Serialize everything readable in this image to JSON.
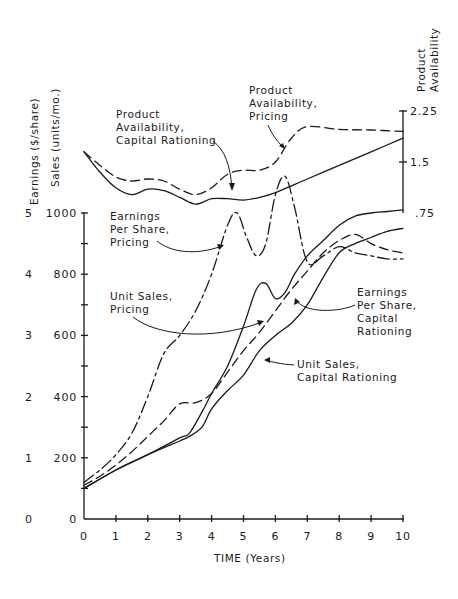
{
  "chart_data": {
    "type": "line",
    "title": "",
    "xlabel": "TIME (Years)",
    "ylabel_left_outer": "Earnings ($/share)",
    "ylabel_left_inner": "Sales (units/mo.)",
    "ylabel_right": "Product Availability",
    "x_ticks": [
      "0",
      "1",
      "2",
      "3",
      "4",
      "5",
      "6",
      "7",
      "8",
      "9",
      "10"
    ],
    "xlim": [
      0,
      10
    ],
    "y_left_earnings_ticks": [
      "0",
      "1",
      "2",
      "3",
      "4",
      "5"
    ],
    "y_left_sales_ticks": [
      "0",
      "200",
      "400",
      "600",
      "800",
      "1000"
    ],
    "ylim_sales": [
      0,
      1000
    ],
    "ylim_earnings": [
      0,
      5
    ],
    "y_right_ticks": [
      ".75",
      "1.5",
      "2.25"
    ],
    "ylim_right": [
      0.75,
      2.25
    ],
    "grid": false,
    "legend": "inline annotations with leader arrows",
    "series": [
      {
        "name": "Product Availability, Capital Rationing",
        "style": "solid",
        "axis": "right",
        "x": [
          0,
          0.5,
          1,
          1.5,
          2,
          2.5,
          3,
          3.5,
          4,
          4.5,
          5,
          5.5,
          6,
          7,
          8,
          9,
          10
        ],
        "y": [
          1.65,
          1.35,
          1.12,
          1.02,
          1.1,
          1.08,
          0.98,
          0.88,
          0.96,
          0.96,
          0.94,
          0.98,
          1.05,
          1.25,
          1.45,
          1.65,
          1.85
        ]
      },
      {
        "name": "Product Availability, Pricing",
        "style": "dashed",
        "axis": "right",
        "x": [
          0,
          0.5,
          1,
          1.5,
          2,
          2.5,
          3,
          3.5,
          4,
          4.5,
          5,
          5.5,
          6,
          6.5,
          7,
          8,
          9,
          10
        ],
        "y": [
          1.65,
          1.45,
          1.28,
          1.22,
          1.25,
          1.22,
          1.1,
          1.02,
          1.12,
          1.32,
          1.38,
          1.38,
          1.5,
          1.85,
          2.02,
          1.98,
          1.97,
          1.95
        ]
      },
      {
        "name": "Earnings Per Share, Pricing",
        "style": "dash-dot",
        "axis": "left_earnings",
        "x": [
          0,
          0.5,
          1,
          1.5,
          2,
          2.5,
          3,
          3.5,
          4,
          4.5,
          4.8,
          5.1,
          5.4,
          5.7,
          6.0,
          6.3,
          6.6,
          7,
          7.5,
          8,
          8.5,
          9,
          9.5,
          10
        ],
        "y": [
          0.6,
          0.8,
          1.05,
          1.4,
          2.0,
          2.7,
          3.0,
          3.4,
          4.0,
          4.8,
          5.0,
          4.6,
          4.3,
          4.5,
          5.3,
          5.6,
          5.1,
          4.2,
          4.3,
          4.45,
          4.35,
          4.3,
          4.25,
          4.25
        ]
      },
      {
        "name": "Unit Sales, Pricing",
        "style": "solid-thin",
        "axis": "left_sales",
        "x": [
          0,
          1,
          2,
          3,
          3.3,
          3.7,
          4,
          4.5,
          5,
          5.4,
          5.7,
          6,
          6.3,
          6.6,
          7,
          7.5,
          8,
          8.5,
          9,
          9.5,
          10
        ],
        "y": [
          100,
          160,
          210,
          265,
          280,
          350,
          410,
          500,
          630,
          750,
          770,
          720,
          740,
          800,
          860,
          910,
          960,
          990,
          1000,
          1005,
          1010
        ]
      },
      {
        "name": "Earnings Per Share, Capital Rationing",
        "style": "dashed",
        "axis": "left_earnings",
        "x": [
          0,
          0.5,
          1,
          1.5,
          2,
          2.5,
          3,
          3.5,
          4,
          4.5,
          5,
          5.5,
          6,
          6.5,
          7,
          7.5,
          8,
          8.5,
          9,
          9.5,
          10
        ],
        "y": [
          0.55,
          0.7,
          0.88,
          1.1,
          1.35,
          1.6,
          1.88,
          1.9,
          2.05,
          2.4,
          2.75,
          3.05,
          3.4,
          3.75,
          4.05,
          4.35,
          4.55,
          4.65,
          4.5,
          4.4,
          4.35
        ]
      },
      {
        "name": "Unit Sales, Capital Rationing",
        "style": "solid",
        "axis": "left_sales",
        "x": [
          0,
          1,
          2,
          3,
          3.3,
          3.7,
          4,
          4.5,
          5,
          5.5,
          6,
          6.5,
          7,
          7.5,
          8,
          8.5,
          9,
          9.5,
          10
        ],
        "y": [
          100,
          160,
          210,
          255,
          270,
          300,
          360,
          420,
          470,
          550,
          600,
          640,
          700,
          790,
          870,
          900,
          920,
          940,
          950
        ]
      }
    ],
    "annotations": [
      "Product Availability, Capital Rationing",
      "Product Availability, Pricing",
      "Earnings Per Share, Pricing",
      "Unit Sales, Pricing",
      "Earnings Per Share, Capital Rationing",
      "Unit Sales, Capital Rationing"
    ]
  },
  "labels": {
    "y_earnings": "Earnings ($/share)",
    "y_sales": "Sales (units/mo.)",
    "y_right_1": "Product",
    "y_right_2": "Availability",
    "x_axis": "TIME (Years)",
    "ann_pacr": [
      "Product",
      "Availability,",
      "Capital Rationing"
    ],
    "ann_pap": [
      "Product",
      "Availability,",
      "Pricing"
    ],
    "ann_epsp": [
      "Earnings",
      "Per Share,",
      "Pricing"
    ],
    "ann_usp": [
      "Unit Sales,",
      "Pricing"
    ],
    "ann_epscr": [
      "Earnings",
      "Per Share,",
      "Capital",
      "Rationing"
    ],
    "ann_uscr": [
      "Unit Sales,",
      "Capital Rationing"
    ]
  },
  "colors": {
    "ink": "#1a1a1a",
    "background": "#ffffff"
  }
}
